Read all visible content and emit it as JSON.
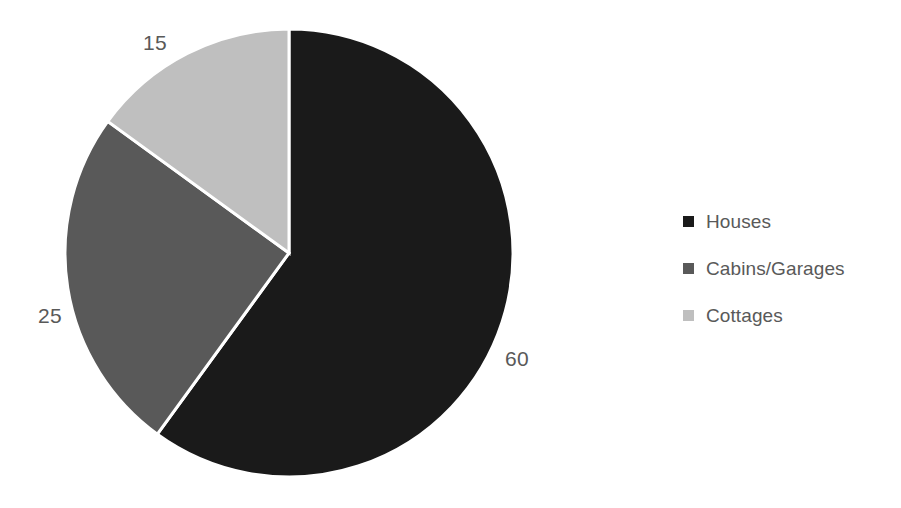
{
  "chart_data": {
    "type": "pie",
    "title": "",
    "subtitle": "",
    "xlabel": "",
    "ylabel": "",
    "categories": [
      "Houses",
      "Cabins/Garages",
      "Cottages"
    ],
    "values": [
      60,
      25,
      15
    ],
    "data_labels": [
      "60",
      "25",
      "15"
    ],
    "colors": [
      "#1a1a1a",
      "#595959",
      "#bfbfbf"
    ],
    "slice_colors": {
      "houses": "#1a1a1a",
      "cabins_garages": "#595959",
      "cottages": "#bfbfbf"
    },
    "total": 100,
    "start_angle_deg": 0,
    "direction": "clockwise",
    "separator_color": "#ffffff",
    "label_color": "#595959",
    "legend_position": "right",
    "grid": false,
    "slices": [
      {
        "name": "Houses",
        "value": 60,
        "label": "60",
        "color": "#1a1a1a",
        "angle_deg": 216
      },
      {
        "name": "Cabins/Garages",
        "value": 25,
        "label": "25",
        "color": "#595959",
        "angle_deg": 90
      },
      {
        "name": "Cottages",
        "value": 15,
        "label": "15",
        "color": "#bfbfbf",
        "angle_deg": 54
      }
    ]
  },
  "labels": {
    "houses": "60",
    "cabins_garages": "25",
    "cottages": "15"
  },
  "legend": {
    "items": [
      {
        "label": "Houses",
        "color": "#1a1a1a",
        "swatch": "square-marker"
      },
      {
        "label": "Cabins/Garages",
        "color": "#595959",
        "swatch": "square-marker"
      },
      {
        "label": "Cottages",
        "color": "#bfbfbf",
        "swatch": "square-marker"
      }
    ]
  }
}
